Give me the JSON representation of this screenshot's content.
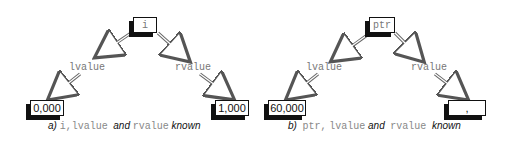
{
  "diagrams": [
    {
      "id": "a",
      "root": {
        "label": "i"
      },
      "branches": [
        {
          "label": "lvalue",
          "value": "0,000"
        },
        {
          "label": "rvalue",
          "value": "1,000"
        }
      ],
      "caption": {
        "prefix": "a)",
        "code1": "i,lvalue",
        "and": "and",
        "code2": "rvalue",
        "suffix": "known"
      }
    },
    {
      "id": "b",
      "root": {
        "label": "ptr"
      },
      "branches": [
        {
          "label": "lvalue",
          "value": "60,000"
        },
        {
          "label": "rvalue",
          "value": ","
        }
      ],
      "caption": {
        "prefix": "b)",
        "code1": "ptr,",
        "code1b": "lvalue",
        "and": "and",
        "code2": "rvalue",
        "suffix": "known"
      }
    }
  ],
  "colors": {
    "ink": "#111111",
    "label_gray": "#777777",
    "background": "#ffffff"
  }
}
